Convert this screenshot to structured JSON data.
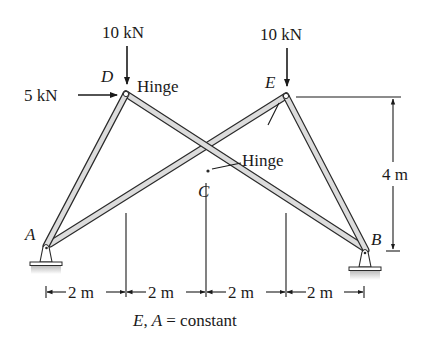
{
  "figure": {
    "type": "structural-frame",
    "loads": [
      {
        "id": "load-D-vertical",
        "label": "10 kN",
        "node": "D",
        "direction": "down"
      },
      {
        "id": "load-E-vertical",
        "label": "10 kN",
        "node": "E",
        "direction": "down"
      },
      {
        "id": "load-D-horizontal",
        "label": "5 kN",
        "node": "D",
        "direction": "right"
      }
    ],
    "nodes": {
      "A": {
        "label": "A",
        "support": "pin"
      },
      "B": {
        "label": "B",
        "support": "pin"
      },
      "C": {
        "label": "C"
      },
      "D": {
        "label": "D"
      },
      "E": {
        "label": "E"
      }
    },
    "members": [
      {
        "from": "A",
        "to": "D"
      },
      {
        "from": "D",
        "to": "B"
      },
      {
        "from": "A",
        "to": "E"
      },
      {
        "from": "E",
        "to": "B"
      }
    ],
    "hinges": [
      {
        "label": "Hinge",
        "location": "D"
      },
      {
        "label": "Hinge",
        "location": "C-E"
      }
    ],
    "dimensions": {
      "horizontal": [
        "2 m",
        "2 m",
        "2 m",
        "2 m"
      ],
      "vertical": "4 m"
    },
    "note": {
      "label_italic_1": "E",
      "comma": ",",
      "label_italic_2": "A",
      "rest": " = constant"
    }
  }
}
